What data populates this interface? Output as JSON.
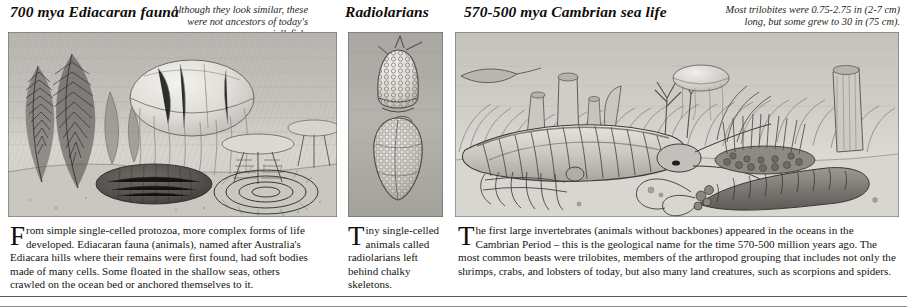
{
  "page": {
    "background_color": "#ffffff",
    "ink_color": "#17130f"
  },
  "sections": [
    {
      "id": "ediacaran",
      "heading": "700 mya Ediacaran fauna",
      "caption_lines": [
        "Although they look similar, these",
        "were not ancestors of today's jellyfish."
      ],
      "illustration_name": "ediacaran-seafloor-illustration",
      "illustration_alt": "Grayscale engraving of Ediacaran frond fossils, a jellyfish, and segmented disc organisms on the sea bed",
      "body_dropcap": "F",
      "body_text": "rom simple single-celled protozoa, more complex forms of life developed. Ediacaran fauna (animals), named after Australia's Ediacara hills where their remains were first found, had soft bodies made of many cells. Some floated in the shallow seas, others crawled on the ocean bed or anchored themselves to it."
    },
    {
      "id": "radiolarians",
      "heading": "Radiolarians",
      "caption_lines": [],
      "illustration_name": "radiolarian-shells-illustration",
      "illustration_alt": "Two honeycomb-patterned radiolarian chalky skeletons on a gray ground",
      "body_dropcap": "T",
      "body_text": "iny single-celled animals called radiolarians left behind chalky skeletons."
    },
    {
      "id": "cambrian",
      "heading": "570-500 mya Cambrian sea life",
      "caption_lines": [
        "Most trilobites were 0.75-2.75 in (2-7 cm)",
        "long, but some grew to 30 in (75 cm)."
      ],
      "illustration_name": "cambrian-sea-life-illustration",
      "illustration_alt": "Grayscale engraving of a Cambrian sea floor with a large trilobite, sponges, a jellyfish and segmented worms",
      "body_dropcap": "T",
      "body_text": "he first large invertebrates (animals without backbones) appeared in the oceans in the Cambrian Period – this is the geological name for the time 570-500 million years ago. The most common beasts were trilobites, members of the arthropod grouping that includes not only the shrimps, crabs, and lobsters of today, but also many land creatures, such as scorpions and spiders."
    }
  ]
}
